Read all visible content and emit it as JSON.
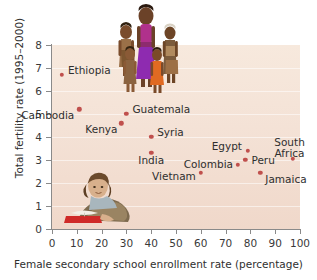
{
  "chart_data": {
    "type": "scatter",
    "title": "",
    "xlabel": "Female secondary school enrollment rate (percentage)",
    "ylabel": "Total fertility rate (1995–2000)",
    "xlim": [
      0,
      100
    ],
    "ylim": [
      0,
      8
    ],
    "xticks": [
      "0",
      "10",
      "20",
      "30",
      "40",
      "50",
      "60",
      "70",
      "80",
      "90",
      "100"
    ],
    "yticks": [
      "0",
      "1",
      "2",
      "3",
      "4",
      "5",
      "6",
      "7",
      "8"
    ],
    "grid": true,
    "legend": "none",
    "point_color": "#c0504d",
    "plot_background": "#f5e4d7",
    "points": [
      {
        "label": "Ethiopia",
        "x": 4,
        "y": 6.7
      },
      {
        "label": "Cambodia",
        "x": 11,
        "y": 5.2
      },
      {
        "label": "Guatemala",
        "x": 30,
        "y": 5.0
      },
      {
        "label": "Kenya",
        "x": 28,
        "y": 4.6
      },
      {
        "label": "Syria",
        "x": 40,
        "y": 4.0
      },
      {
        "label": "India",
        "x": 40,
        "y": 3.3
      },
      {
        "label": "Egypt",
        "x": 79,
        "y": 3.4
      },
      {
        "label": "South Africa",
        "x": 97,
        "y": 3.05
      },
      {
        "label": "Colombia",
        "x": 75,
        "y": 2.8
      },
      {
        "label": "Peru",
        "x": 78,
        "y": 3.0
      },
      {
        "label": "Vietnam",
        "x": 60,
        "y": 2.45
      },
      {
        "label": "Jamaica",
        "x": 84,
        "y": 2.45
      }
    ],
    "annotations": [
      {
        "name": "family-photo",
        "description": "photograph of a mother with four children"
      },
      {
        "name": "reader-photo",
        "description": "photograph of a girl reading an open book"
      }
    ]
  }
}
